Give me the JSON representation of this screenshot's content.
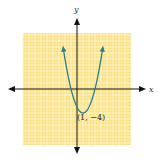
{
  "chart_data": {
    "type": "line",
    "title": "",
    "xlabel": "x",
    "ylabel": "y",
    "function": "y = (x - 1)^2 - 4",
    "vertex": {
      "x": 1,
      "y": -4,
      "label": "(1, −4)"
    },
    "x_intercepts": [
      -1,
      3
    ],
    "y_intercept": -3,
    "xlim": [
      -9,
      9
    ],
    "ylim": [
      -9,
      9
    ],
    "grid": true,
    "grid_color": "#f9e07f",
    "grid_line_color": "#fff6d2",
    "curve_color": "#2a7f8a",
    "axis_color": "#111111",
    "series": [
      {
        "name": "parabola",
        "x": [
          -2.2,
          -2,
          -1,
          0,
          1,
          2,
          3,
          4,
          4.2
        ],
        "y": [
          6.24,
          5,
          0,
          -3,
          -4,
          -3,
          0,
          5,
          6.24
        ]
      }
    ],
    "tick_labels": []
  },
  "labels": {
    "x_axis": "x",
    "y_axis": "y",
    "vertex": "(1, −4)"
  }
}
